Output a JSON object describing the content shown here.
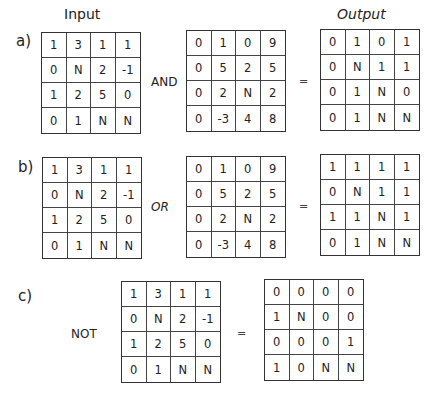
{
  "headers": {
    "input": "Input",
    "output": "Output"
  },
  "panels": [
    {
      "label": "a)",
      "operator": "AND",
      "equals": "=",
      "input": [
        [
          "1",
          "3",
          "1",
          "1"
        ],
        [
          "0",
          "N",
          "2",
          "-1"
        ],
        [
          "1",
          "2",
          "5",
          "0"
        ],
        [
          "0",
          "1",
          "N",
          "N"
        ]
      ],
      "operand": [
        [
          "0",
          "1",
          "0",
          "9"
        ],
        [
          "0",
          "5",
          "2",
          "5"
        ],
        [
          "0",
          "2",
          "N",
          "2"
        ],
        [
          "0",
          "-3",
          "4",
          "8"
        ]
      ],
      "output": [
        [
          "0",
          "1",
          "0",
          "1"
        ],
        [
          "0",
          "N",
          "1",
          "1"
        ],
        [
          "0",
          "1",
          "N",
          "0"
        ],
        [
          "0",
          "1",
          "N",
          "N"
        ]
      ]
    },
    {
      "label": "b)",
      "operator": "OR",
      "equals": "=",
      "input": [
        [
          "1",
          "3",
          "1",
          "1"
        ],
        [
          "0",
          "N",
          "2",
          "-1"
        ],
        [
          "1",
          "2",
          "5",
          "0"
        ],
        [
          "0",
          "1",
          "N",
          "N"
        ]
      ],
      "operand": [
        [
          "0",
          "1",
          "0",
          "9"
        ],
        [
          "0",
          "5",
          "2",
          "5"
        ],
        [
          "0",
          "2",
          "N",
          "2"
        ],
        [
          "0",
          "-3",
          "4",
          "8"
        ]
      ],
      "output": [
        [
          "1",
          "1",
          "1",
          "1"
        ],
        [
          "0",
          "N",
          "1",
          "1"
        ],
        [
          "1",
          "1",
          "N",
          "1"
        ],
        [
          "0",
          "1",
          "N",
          "N"
        ]
      ]
    },
    {
      "label": "c)",
      "operator": "NOT",
      "equals": "=",
      "input": [
        [
          "1",
          "3",
          "1",
          "1"
        ],
        [
          "0",
          "N",
          "2",
          "-1"
        ],
        [
          "1",
          "2",
          "5",
          "0"
        ],
        [
          "0",
          "1",
          "N",
          "N"
        ]
      ],
      "output": [
        [
          "0",
          "0",
          "0",
          "0"
        ],
        [
          "1",
          "N",
          "0",
          "0"
        ],
        [
          "0",
          "0",
          "0",
          "1"
        ],
        [
          "1",
          "0",
          "N",
          "N"
        ]
      ]
    }
  ]
}
